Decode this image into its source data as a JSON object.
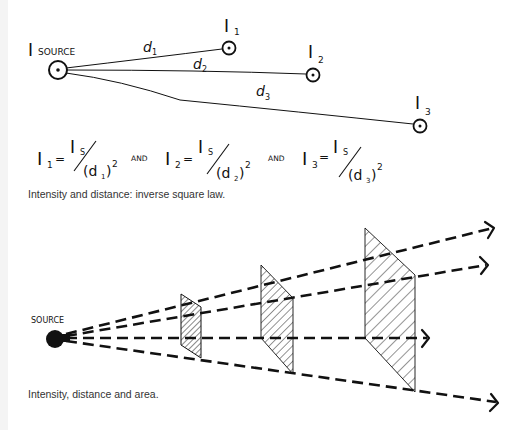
{
  "figure_top": {
    "source_label_main": "I",
    "source_label_sub": "SOURCE",
    "points": [
      {
        "label": "I",
        "sub": "1",
        "distance_label": "d",
        "distance_sub": "1"
      },
      {
        "label": "I",
        "sub": "2",
        "distance_label": "d",
        "distance_sub": "2"
      },
      {
        "label": "I",
        "sub": "3",
        "distance_label": "d",
        "distance_sub": "3"
      }
    ],
    "formulas": [
      {
        "lhs": "I",
        "lhs_sub": "1",
        "eq": "=",
        "num": "I",
        "num_sub": "S",
        "den": "(d",
        "den_sub": "1",
        "den_close": ")",
        "exp": "2"
      },
      {
        "lhs": "I",
        "lhs_sub": "2",
        "eq": "=",
        "num": "I",
        "num_sub": "S",
        "den": "(d",
        "den_sub": "2",
        "den_close": ")",
        "exp": "2"
      },
      {
        "lhs": "I",
        "lhs_sub": "3",
        "eq": "=",
        "num": "I",
        "num_sub": "S",
        "den": "(d",
        "den_sub": "3",
        "den_close": ")",
        "exp": "2"
      }
    ],
    "connector": "AND",
    "caption": "Intensity and distance: inverse square law."
  },
  "figure_bottom": {
    "source_label": "SOURCE",
    "caption": "Intensity, distance and area."
  },
  "colors": {
    "ink": "#111111",
    "caption_text": "#333333",
    "background": "#ffffff"
  }
}
